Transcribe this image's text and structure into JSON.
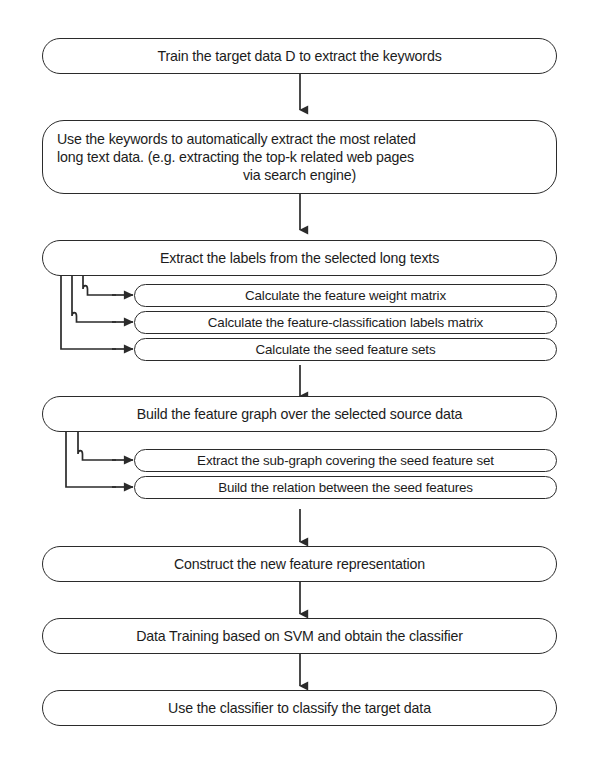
{
  "diagram": {
    "caption_partial": "",
    "style": {
      "stroke_color": "#2b2b2b",
      "text_color": "#1c1c1c",
      "background": "#ffffff"
    },
    "main_steps": [
      {
        "id": "step-train-target-data",
        "lines": [
          "Train the target data D to extract the keywords"
        ]
      },
      {
        "id": "step-extract-long-text",
        "lines": [
          "Use the keywords to automatically extract the most related",
          "long text data. (e.g. extracting the top-k related web pages",
          "via search engine)"
        ]
      },
      {
        "id": "step-extract-labels",
        "lines": [
          "Extract the labels from the selected long texts"
        ]
      },
      {
        "id": "step-build-feature-graph",
        "lines": [
          "Build the feature graph over the selected source data"
        ]
      },
      {
        "id": "step-construct-representation",
        "lines": [
          "Construct the new feature representation"
        ]
      },
      {
        "id": "step-data-training-svm",
        "lines": [
          "Data Training based on SVM and obtain the classifier"
        ]
      },
      {
        "id": "step-use-classifier",
        "lines": [
          "Use the classifier to classify the target data"
        ]
      }
    ],
    "substeps_group_one": [
      {
        "id": "sub-feature-weight-matrix",
        "label": "Calculate the feature weight matrix"
      },
      {
        "id": "sub-feature-classification-labels-matrix",
        "label": "Calculate the feature-classification labels matrix"
      },
      {
        "id": "sub-seed-feature-sets",
        "label": "Calculate the seed feature sets"
      }
    ],
    "substeps_group_two": [
      {
        "id": "sub-extract-subgraph",
        "label": "Extract the sub-graph covering the seed feature set"
      },
      {
        "id": "sub-build-relation",
        "label": "Build the relation between the seed features"
      }
    ],
    "connectors": [
      {
        "id": "arrow-1",
        "from": "step-train-target-data",
        "to": "step-extract-long-text",
        "kind": "vertical-arrow"
      },
      {
        "id": "arrow-2",
        "from": "step-extract-long-text",
        "to": "step-extract-labels",
        "kind": "vertical-arrow"
      },
      {
        "id": "branch-1",
        "from": "step-extract-labels",
        "to": "substeps_group_one",
        "kind": "branch-right-arrows"
      },
      {
        "id": "arrow-3",
        "from": "step-extract-labels",
        "to": "step-build-feature-graph",
        "kind": "vertical-arrow"
      },
      {
        "id": "branch-2",
        "from": "step-build-feature-graph",
        "to": "substeps_group_two",
        "kind": "branch-right-arrows"
      },
      {
        "id": "arrow-4",
        "from": "step-build-feature-graph",
        "to": "step-construct-representation",
        "kind": "vertical-arrow"
      },
      {
        "id": "arrow-5",
        "from": "step-construct-representation",
        "to": "step-data-training-svm",
        "kind": "vertical-arrow"
      },
      {
        "id": "arrow-6",
        "from": "step-data-training-svm",
        "to": "step-use-classifier",
        "kind": "vertical-arrow"
      }
    ]
  }
}
